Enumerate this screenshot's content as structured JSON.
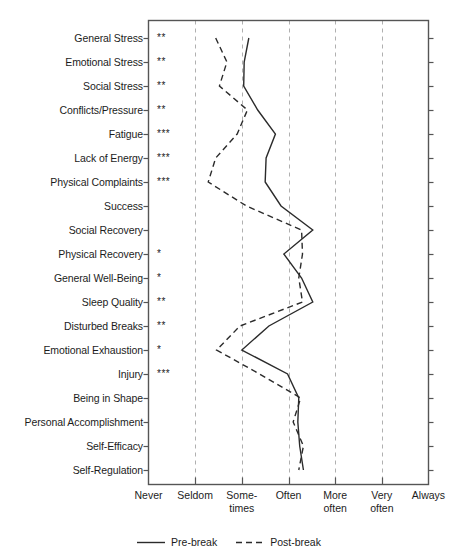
{
  "chart_data": {
    "type": "line",
    "orientation": "horizontal",
    "title": "",
    "subtitle": "",
    "xlabel": "",
    "ylabel": "",
    "grid": true,
    "grid_axis": "x",
    "legend_position": "bottom-center",
    "x_tick_labels": [
      "Never",
      "Seldom",
      "Some-\ntimes",
      "Often",
      "More\noften",
      "Very\noften",
      "Always"
    ],
    "x_tick_values": [
      1,
      2,
      3,
      4,
      5,
      6,
      7
    ],
    "xlim": [
      1,
      7
    ],
    "categories": [
      "General Stress",
      "Emotional Stress",
      "Social Stress",
      "Conflicts/Pressure",
      "Fatigue",
      "Lack of Energy",
      "Physical Complaints",
      "Success",
      "Social Recovery",
      "Physical Recovery",
      "General Well-Being",
      "Sleep Quality",
      "Disturbed Breaks",
      "Emotional Exhaustion",
      "Injury",
      "Being in Shape",
      "Personal Accomplishment",
      "Self-Efficacy",
      "Self-Regulation"
    ],
    "significance": [
      "**",
      "**",
      "**",
      "**",
      "***",
      "***",
      "***",
      "",
      "",
      "*",
      "*",
      "**",
      "**",
      "*",
      "***",
      "",
      "",
      "",
      ""
    ],
    "significance_note": "stars denote statistical significance level per scale",
    "series": [
      {
        "name": "Pre-break",
        "style": "solid",
        "color": "#2b2b2b",
        "values": [
          3.15,
          3.05,
          3.04,
          3.34,
          3.72,
          3.52,
          3.5,
          3.84,
          4.52,
          3.9,
          4.28,
          4.52,
          3.58,
          3.0,
          3.98,
          4.22,
          4.2,
          4.24,
          4.32
        ]
      },
      {
        "name": "Post-break",
        "style": "dashed",
        "color": "#2b2b2b",
        "values": [
          2.44,
          2.68,
          2.52,
          3.12,
          2.9,
          2.44,
          2.28,
          3.1,
          4.28,
          4.3,
          4.22,
          4.3,
          2.96,
          2.46,
          3.38,
          4.26,
          4.1,
          4.32,
          4.22
        ]
      }
    ]
  },
  "legend": {
    "entries": [
      {
        "label": "Pre-break",
        "style": "solid"
      },
      {
        "label": "Post-break",
        "style": "dashed"
      }
    ]
  }
}
